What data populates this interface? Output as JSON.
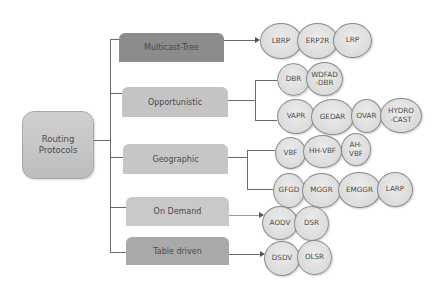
{
  "root": {
    "label_line1": "Routing",
    "label_line2": "Protocols"
  },
  "categories": [
    {
      "label": "Multicast-Tree",
      "color": "#8c8c8c"
    },
    {
      "label": "Opportunistic",
      "color": "#c4c4c4"
    },
    {
      "label": "Geographic",
      "color": "#c6c6c6"
    },
    {
      "label": "On Demand",
      "color": "#c9c9c9"
    },
    {
      "label": "Table driven",
      "color": "#a9a9a9"
    }
  ],
  "protocols": {
    "multicast_tree": [
      "LBRP",
      "ERP2R",
      "LRP"
    ],
    "opportunistic_row1": [
      "DBR",
      "WDFAD\n-DBR"
    ],
    "opportunistic_row2": [
      "VAPR",
      "GEDAR",
      "OVAR",
      "HYDRO\n-CAST"
    ],
    "geographic_row1": [
      "VBF",
      "HH-VBF",
      "AH-\nVBF"
    ],
    "geographic_row2": [
      "GFGD",
      "MGGR",
      "EMGGR",
      "LARP"
    ],
    "on_demand": [
      "AODV",
      "DSR"
    ],
    "table_driven": [
      "DSDV",
      "OLSR"
    ]
  }
}
